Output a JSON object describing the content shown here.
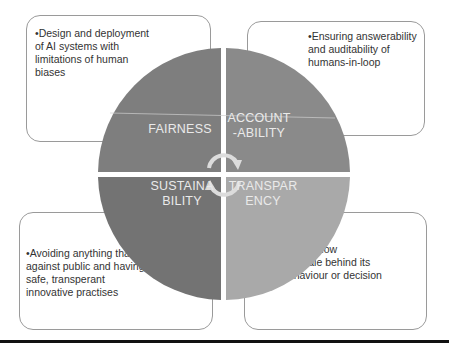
{
  "diagram": {
    "type": "four-quadrant-cycle",
    "center_icon": "circular-arrows-icon",
    "colors": {
      "fairness": "#7e7e7e",
      "accountability": "#8a8a8a",
      "sustainability": "#737373",
      "transparency": "#a9a9a9",
      "label_text": "#eaeaea",
      "box_border": "#9a9a9a"
    },
    "quadrants": [
      {
        "id": "fairness",
        "label_line1": "FAIRNESS",
        "label_line2": "",
        "description": "•Design and deployment of AI systems with limitations of human biases"
      },
      {
        "id": "accountability",
        "label_line1": "ACCOUNT",
        "label_line2": "-ABILITY",
        "description": "•Ensuring answerability and auditability of humans-in-loop"
      },
      {
        "id": "sustainability",
        "label_line1": "SUSTAINA",
        "label_line2": "BILITY",
        "description": "•Avoiding anything that is against public and having safe, transperant innovative practises"
      },
      {
        "id": "transparency",
        "label_line1": "TRANSPAR",
        "label_line2": "ENCY",
        "description_intro": "Ability to know",
        "description_bullets": [
          "rationale behind its",
          "behaviour or decision"
        ]
      }
    ]
  }
}
